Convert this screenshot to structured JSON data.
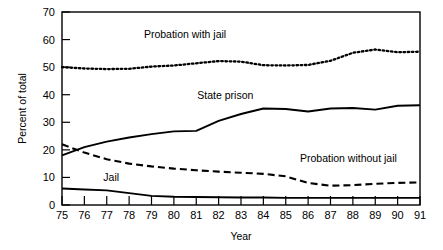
{
  "chart_data": {
    "type": "line",
    "title": "",
    "xlabel": "Year",
    "ylabel": "Percent of total",
    "xlim": [
      75,
      91
    ],
    "ylim": [
      0,
      70
    ],
    "ytick_step": 10,
    "grid": false,
    "legend_position": "inline-annotations",
    "x": [
      75,
      76,
      77,
      78,
      79,
      80,
      81,
      82,
      83,
      84,
      85,
      86,
      87,
      88,
      89,
      90,
      91
    ],
    "xtick_labels": [
      "75",
      "76",
      "77",
      "78",
      "79",
      "80",
      "81",
      "82",
      "83",
      "84",
      "85",
      "86",
      "87",
      "88",
      "89",
      "90",
      "91"
    ],
    "ytick_labels": [
      "0",
      "10",
      "20",
      "30",
      "40",
      "50",
      "60",
      "70"
    ],
    "series": [
      {
        "name": "Probation with jail",
        "style": "dotted",
        "color": "#000000",
        "label_x": 80.5,
        "label_y": 60.5,
        "values": [
          50.0,
          49.5,
          49.3,
          49.4,
          50.2,
          50.6,
          51.4,
          52.2,
          52.0,
          50.7,
          50.6,
          50.8,
          52.3,
          55.2,
          56.4,
          55.4,
          55.6
        ]
      },
      {
        "name": "State prison",
        "style": "solid",
        "color": "#000000",
        "label_x": 82.3,
        "label_y": 38.5,
        "values": [
          18.0,
          21.0,
          23.0,
          24.5,
          25.7,
          26.7,
          26.9,
          30.5,
          33.0,
          35.0,
          34.8,
          33.9,
          35.0,
          35.2,
          34.6,
          36.0,
          36.2
        ]
      },
      {
        "name": "Probation without jail",
        "style": "dashed",
        "color": "#000000",
        "label_x": 87.8,
        "label_y": 15.5,
        "values": [
          22.0,
          19.0,
          16.6,
          15.0,
          14.0,
          13.2,
          12.6,
          12.1,
          11.7,
          11.3,
          10.4,
          8.0,
          7.0,
          7.2,
          7.7,
          8.0,
          8.2
        ]
      },
      {
        "name": "Jail",
        "style": "solid",
        "color": "#000000",
        "label_x": 77.2,
        "label_y": 8.6,
        "values": [
          6.0,
          5.6,
          5.3,
          4.3,
          3.3,
          3.0,
          2.9,
          2.8,
          2.7,
          2.7,
          2.6,
          2.6,
          2.6,
          2.6,
          2.6,
          2.6,
          2.6
        ]
      }
    ]
  },
  "axes": {
    "x_axis_title": "Year",
    "y_axis_title": "Percent of total"
  }
}
